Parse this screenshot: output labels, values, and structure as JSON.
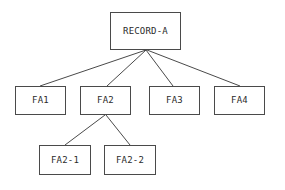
{
  "diagram": {
    "type": "tree",
    "title": "",
    "background_color": "#ffffff",
    "line_color": "#4a4a4a",
    "text_color": "#2b2b2b",
    "box_fill_color": "#ffffff",
    "levels": 3,
    "nodes": [
      {
        "id": "record-a",
        "label": "RECORD-A",
        "level": 0,
        "x": 110,
        "y": 12,
        "w": 71,
        "h": 38,
        "parent": null
      },
      {
        "id": "fa1",
        "label": "FA1",
        "level": 1,
        "x": 15,
        "y": 86,
        "w": 51,
        "h": 29,
        "parent": "record-a"
      },
      {
        "id": "fa2",
        "label": "FA2",
        "level": 1,
        "x": 80,
        "y": 86,
        "w": 51,
        "h": 29,
        "parent": "record-a"
      },
      {
        "id": "fa3",
        "label": "FA3",
        "level": 1,
        "x": 149,
        "y": 86,
        "w": 51,
        "h": 29,
        "parent": "record-a"
      },
      {
        "id": "fa4",
        "label": "FA4",
        "level": 1,
        "x": 214,
        "y": 86,
        "w": 51,
        "h": 29,
        "parent": "record-a"
      },
      {
        "id": "fa2-1",
        "label": "FA2-1",
        "level": 2,
        "x": 39,
        "y": 145,
        "w": 52,
        "h": 30,
        "parent": "fa2"
      },
      {
        "id": "fa2-2",
        "label": "FA2-2",
        "level": 2,
        "x": 104,
        "y": 145,
        "w": 52,
        "h": 30,
        "parent": "fa2"
      }
    ],
    "edges": [
      {
        "id": "edge-record-a-fa1",
        "from": "record-a",
        "to": "fa1",
        "x1": 146,
        "y1": 50,
        "x2": 40,
        "y2": 86
      },
      {
        "id": "edge-record-a-fa2",
        "from": "record-a",
        "to": "fa2",
        "x1": 146,
        "y1": 50,
        "x2": 107,
        "y2": 86
      },
      {
        "id": "edge-record-a-fa3",
        "from": "record-a",
        "to": "fa3",
        "x1": 146,
        "y1": 50,
        "x2": 173,
        "y2": 86
      },
      {
        "id": "edge-record-a-fa4",
        "from": "record-a",
        "to": "fa4",
        "x1": 147,
        "y1": 50,
        "x2": 240,
        "y2": 86
      },
      {
        "id": "edge-fa2-fa2-1",
        "from": "fa2",
        "to": "fa2-1",
        "x1": 105,
        "y1": 115,
        "x2": 65,
        "y2": 145
      },
      {
        "id": "edge-fa2-fa2-2",
        "from": "fa2",
        "to": "fa2-2",
        "x1": 106,
        "y1": 115,
        "x2": 130,
        "y2": 145
      }
    ]
  }
}
